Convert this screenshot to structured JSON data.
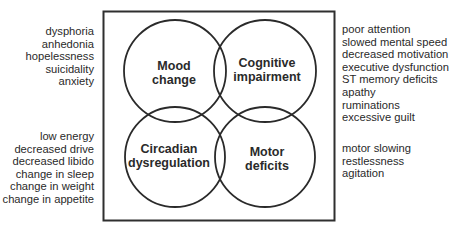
{
  "diagram": {
    "box": {
      "x": 103,
      "y": 11,
      "width": 231,
      "height": 209,
      "stroke": "#2f2f2f"
    },
    "circles": [
      {
        "id": "mood",
        "cx": 175,
        "cy": 71,
        "r": 51,
        "label_lines": [
          "Mood",
          "change"
        ]
      },
      {
        "id": "cognitive",
        "cx": 265,
        "cy": 71,
        "r": 51,
        "label_lines": [
          "Cognitive",
          "impairment"
        ]
      },
      {
        "id": "circadian",
        "cx": 175,
        "cy": 157,
        "r": 50,
        "label_lines": [
          "Circadian",
          "dysregulation"
        ]
      },
      {
        "id": "motor",
        "cx": 265,
        "cy": 157,
        "r": 50,
        "label_lines": [
          "Motor",
          "deficits"
        ]
      }
    ],
    "symptom_lists": {
      "mood": [
        "dysphoria",
        "anhedonia",
        "hopelessness",
        "suicidality",
        "anxiety"
      ],
      "circadian": [
        "low energy",
        "decreased drive",
        "decreased libido",
        "change in sleep",
        "change in weight",
        "change in appetite"
      ],
      "cognitive": [
        "poor attention",
        "slowed mental speed",
        "decreased motivation",
        "executive dysfunction",
        "ST memory deficits",
        "apathy",
        "ruminations",
        "excessive guilt"
      ],
      "motor": [
        "motor slowing",
        "restlessness",
        "agitation"
      ]
    },
    "colors": {
      "line": "#2f2f2f",
      "text": "#2a2a2a",
      "background": "#ffffff"
    }
  }
}
